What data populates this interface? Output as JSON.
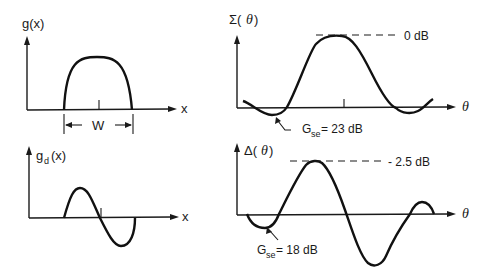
{
  "panels": {
    "g": {
      "ylabel": "g(x)",
      "xlabel": "x",
      "width_label": "W"
    },
    "gd": {
      "ylabel_main": "g",
      "ylabel_sub": "d",
      "ylabel_tail": "(x)",
      "xlabel": "x"
    },
    "sigma": {
      "ylabel": "Σ(",
      "ylabel_theta": "θ",
      "ylabel_close": ")",
      "xlabel": "θ",
      "peak_label": "0 dB",
      "sidelobe_main": "G",
      "sidelobe_sub": "se",
      "sidelobe_value": "= 23 dB"
    },
    "delta": {
      "ylabel": "Δ(",
      "ylabel_theta": "θ",
      "ylabel_close": ")",
      "xlabel": "θ",
      "peak_label": "- 2.5 dB",
      "sidelobe_main": "G",
      "sidelobe_sub": "se",
      "sidelobe_value": "= 18 dB"
    }
  },
  "colors": {
    "ink": "#111111",
    "background": "#ffffff"
  }
}
